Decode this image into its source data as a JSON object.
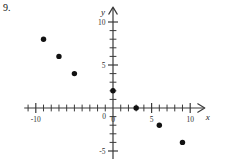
{
  "problem": {
    "number": "9."
  },
  "chart_data": {
    "type": "scatter",
    "title": "",
    "xlabel": "x",
    "ylabel": "y",
    "xlim": [
      -11.5,
      11.5
    ],
    "ylim": [
      -6.5,
      11.5
    ],
    "grid": false,
    "legend": null,
    "x_tick_labels": [
      "-10",
      "0",
      "5",
      "10"
    ],
    "x_tick_label_values": [
      -10,
      0,
      5,
      10
    ],
    "y_tick_labels": [
      "10",
      "5",
      "0",
      "-5"
    ],
    "y_tick_label_values": [
      10,
      5,
      0,
      -5
    ],
    "x_ticks_all": [
      -11,
      -10,
      -9,
      -8,
      -7,
      -6,
      -5,
      -4,
      -3,
      -2,
      -1,
      1,
      2,
      3,
      4,
      5,
      6,
      7,
      8,
      9,
      10
    ],
    "y_ticks_all": [
      -5,
      -4,
      -3,
      -2,
      -1,
      1,
      2,
      3,
      4,
      5,
      6,
      7,
      8,
      9,
      10
    ],
    "points": [
      {
        "x": -9,
        "y": 8
      },
      {
        "x": -7,
        "y": 6
      },
      {
        "x": -5,
        "y": 4
      },
      {
        "x": 0,
        "y": 2
      },
      {
        "x": 3,
        "y": 0
      },
      {
        "x": 6,
        "y": -2
      },
      {
        "x": 9,
        "y": -4
      }
    ],
    "point_color": "#111111",
    "axis_color": "#3a3a3a"
  }
}
